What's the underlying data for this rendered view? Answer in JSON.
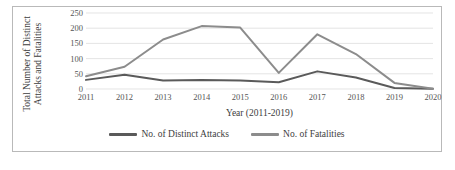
{
  "chart_data": {
    "type": "line",
    "title": "",
    "xlabel": "Year (2011-2019)",
    "ylabel": "Total Number of Distinct Attacks and Fatalities",
    "ylabel_line1": "Total Number of Distinct",
    "ylabel_line2": "Attacks and Fatalities",
    "categories": [
      "2011",
      "2012",
      "2013",
      "2014",
      "2015",
      "2016",
      "2017",
      "2018",
      "2019",
      "2020"
    ],
    "x": [
      2011,
      2012,
      2013,
      2014,
      2015,
      2016,
      2017,
      2018,
      2019,
      2020
    ],
    "ylim": [
      0,
      250
    ],
    "yticks": [
      250,
      200,
      150,
      100,
      50,
      0
    ],
    "grid": true,
    "legend_position": "bottom",
    "series": [
      {
        "name": "No. of Distinct Attacks",
        "color": "#5a5a5a",
        "values": [
          30,
          47,
          28,
          30,
          28,
          22,
          58,
          38,
          3,
          1
        ]
      },
      {
        "name": "No. of Fatalities",
        "color": "#8c8c8c",
        "values": [
          42,
          73,
          163,
          207,
          202,
          53,
          180,
          115,
          20,
          1
        ]
      }
    ]
  },
  "style": {
    "frame_border": "#b9b9b9",
    "gridline": "#dcdcdc",
    "tick_text": "#555555",
    "axis_title_text": "#3d3d3d",
    "background": "#ffffff"
  }
}
